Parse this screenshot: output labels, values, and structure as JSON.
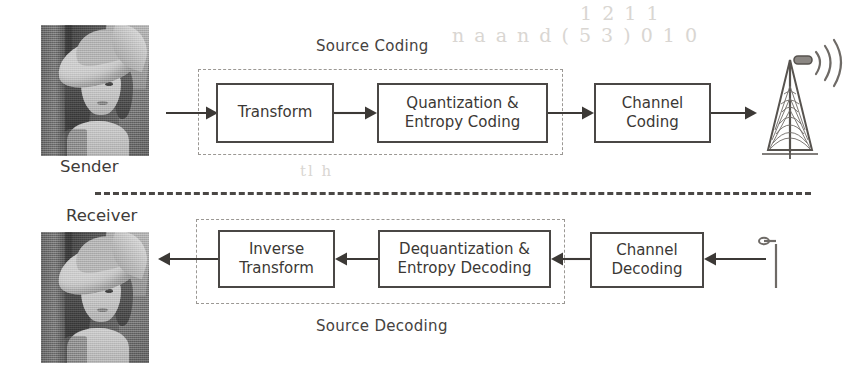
{
  "diagram": {
    "sender": {
      "image_label": "Sender",
      "image_alt": "lena-grayscale-photo",
      "group_label": "Source  Coding",
      "blocks": [
        {
          "id": "transform",
          "label": "Transform"
        },
        {
          "id": "quant-entropy-coding",
          "label": "Quantization &\nEntropy Coding"
        },
        {
          "id": "channel-coding",
          "label": "Channel\nCoding"
        }
      ],
      "endpoint_icon": "transmit-tower-icon"
    },
    "receiver": {
      "image_label": "Receiver",
      "image_alt": "lena-grayscale-photo",
      "group_label": "Source  Decoding",
      "blocks": [
        {
          "id": "inverse-transform",
          "label": "Inverse\nTransform"
        },
        {
          "id": "dequant-entropy-decoding",
          "label": "Dequantization &\nEntropy Decoding"
        },
        {
          "id": "channel-decoding",
          "label": "Channel\nDecoding"
        }
      ],
      "endpoint_icon": "receive-antenna-icon"
    },
    "divider": "dashed-separator",
    "colors": {
      "ink": "#3c3936",
      "box_border": "#4a4745",
      "dashed_border": "#9b9894",
      "background": "#ffffff",
      "artifact": "#d9d6d2"
    },
    "artifacts": [
      {
        "text": "1 2 1 1",
        "x": 580,
        "y": 6
      },
      {
        "text": "n a  a n d    ( 5 3 )      0 1 0",
        "x": 452,
        "y": 28
      },
      {
        "text": "tl  h",
        "x": 300,
        "y": 168
      },
      {
        "text": "·",
        "x": 760,
        "y": 54
      }
    ]
  }
}
